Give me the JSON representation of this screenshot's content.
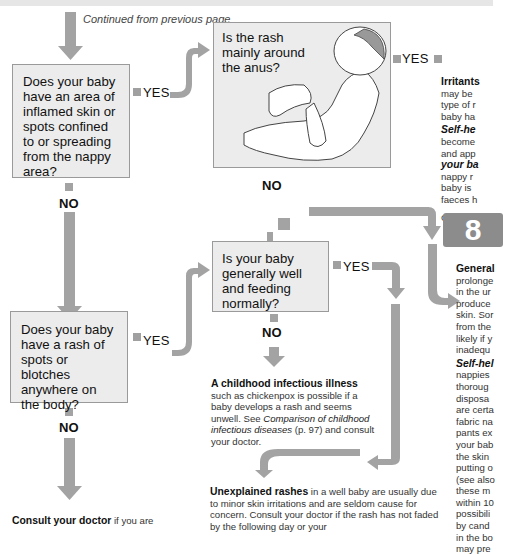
{
  "continued_label": "Continued from previous page",
  "questions": {
    "q1": "Does your baby have an area of inflamed skin or spots confined to or spreading from the nappy area?",
    "q2": "Is the rash mainly around the anus?",
    "q3": "Does your baby have a rash of spots or blotches anywhere on the body?",
    "q4": "Is your baby generally well and feeding normally?"
  },
  "labels": {
    "yes": "YES",
    "no": "NO"
  },
  "outcomes": {
    "irritants": {
      "head": "Irritants",
      "lines": [
        "may be",
        "type of r",
        "baby ha"
      ],
      "selfhelp_head": "Self-he",
      "selfhelp_lines": [
        "become",
        "and app"
      ],
      "italic_line": "your ba",
      "more_lines": [
        "nappy r",
        "baby is",
        "faeces h"
      ],
      "goto": "Go to ch",
      "chapter": "8"
    },
    "general": {
      "head": "General",
      "lines": [
        "prolonge",
        "in the ur",
        "produce",
        "skin. Sor",
        "from the",
        "likely if y",
        "inadequ"
      ],
      "selfhelp_head": "Self-hel",
      "selfhelp_lines": [
        "nappies",
        "thoroug",
        "disposa",
        "are certa",
        "fabric na",
        "pants ex",
        "your bab",
        "the skin",
        "putting o",
        "(see also",
        "these m",
        "within 10",
        "possibili",
        "by cand",
        "in the bo",
        "may pre"
      ]
    },
    "infectious": {
      "head": "A childhood infectious illness",
      "text1": " such as chickenpox is possible if a baby develops a rash and seems unwell. See ",
      "italic": "Comparison of childhood infectious diseases",
      "text2": " (p. 97) and consult your doctor."
    },
    "unexplained": {
      "head": "Unexplained rashes",
      "text": " in a well baby are usually due to minor skin irritations and are seldom cause for concern. Consult your doctor if the rash has not faded by the following day or your"
    },
    "consult": {
      "head": "Consult your doctor",
      "text": " if you are"
    }
  },
  "colors": {
    "arrow": "#a3a3a3",
    "box_fill": "#ececec",
    "box_border": "#9a9a9a",
    "chapter_bg": "#8c8c8c"
  }
}
